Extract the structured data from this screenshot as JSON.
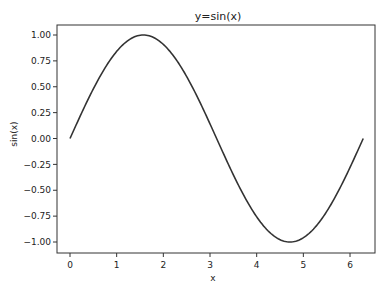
{
  "chart_data": {
    "type": "line",
    "title": "y=sin(x)",
    "xlabel": "x",
    "ylabel": "sin(x)",
    "xlim": [
      -0.31,
      6.59
    ],
    "ylim": [
      -1.1,
      1.1
    ],
    "grid": false,
    "legend": null,
    "x_ticks": [
      0,
      1,
      2,
      3,
      4,
      5,
      6
    ],
    "x_tick_labels": [
      "0",
      "1",
      "2",
      "3",
      "4",
      "5",
      "6"
    ],
    "y_ticks": [
      1.0,
      0.75,
      0.5,
      0.25,
      0.0,
      -0.25,
      -0.5,
      -0.75,
      -1.0
    ],
    "y_tick_labels": [
      "1.00",
      "0.75",
      "0.50",
      "0.25",
      "0.00",
      "−0.25",
      "−0.50",
      "−0.75",
      "−1.00"
    ],
    "series": [
      {
        "name": "sin(x)",
        "color": "#333333",
        "function": "sin",
        "x_range": [
          0,
          6.2832
        ],
        "x": [
          0,
          0.5236,
          1.0472,
          1.5708,
          2.0944,
          2.618,
          3.1416,
          3.6652,
          4.1888,
          4.7124,
          5.236,
          5.7596,
          6.2832
        ],
        "y": [
          0,
          0.5,
          0.866,
          1.0,
          0.866,
          0.5,
          0,
          -0.5,
          -0.866,
          -1.0,
          -0.866,
          -0.5,
          0
        ]
      }
    ]
  }
}
